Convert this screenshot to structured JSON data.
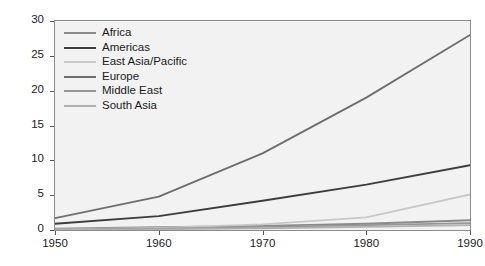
{
  "chart_data": {
    "type": "line",
    "title": "",
    "xlabel": "",
    "ylabel": "Thousand tourists",
    "x": [
      1950,
      1960,
      1970,
      1980,
      1990
    ],
    "xlim": [
      1950,
      1990
    ],
    "ylim": [
      0,
      30
    ],
    "xticks": [
      "1950",
      "1960",
      "1970",
      "1980",
      "1990"
    ],
    "yticks": [
      "0",
      "5",
      "10",
      "15",
      "20",
      "25",
      "30"
    ],
    "grid": false,
    "legend_position": "upper left",
    "series": [
      {
        "name": "Africa",
        "color": "#8a8a8a",
        "values": [
          0.2,
          0.4,
          0.6,
          0.9,
          1.4
        ]
      },
      {
        "name": "Americas",
        "color": "#3d3d3d",
        "values": [
          0.9,
          2.0,
          4.2,
          6.5,
          9.3
        ]
      },
      {
        "name": "East Asia/Pacific",
        "color": "#c8c8c8",
        "values": [
          0.1,
          0.3,
          0.8,
          1.8,
          5.1
        ]
      },
      {
        "name": "Europe",
        "color": "#6e6e6e",
        "values": [
          1.7,
          4.8,
          11.0,
          19.0,
          28.0
        ]
      },
      {
        "name": "Middle East",
        "color": "#969696",
        "values": [
          0.05,
          0.2,
          0.4,
          0.7,
          1.0
        ]
      },
      {
        "name": "South Asia",
        "color": "#b0b0b0",
        "values": [
          0.03,
          0.1,
          0.25,
          0.45,
          0.7
        ]
      }
    ]
  },
  "style": {
    "plot_background": "#f2f2f2",
    "frame_color": "#8c8c8c",
    "text_color": "#1a1a1a",
    "page_background": "#ffffff"
  }
}
